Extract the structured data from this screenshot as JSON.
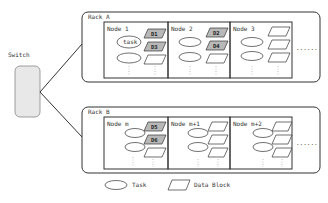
{
  "switch": {
    "label": "Switch"
  },
  "racks": [
    {
      "label": "Rack A",
      "nodes": [
        {
          "label": "Node 1",
          "task_label": "task",
          "blocks": [
            "D1",
            "D3",
            ""
          ]
        },
        {
          "label": "Node 2",
          "task_label": "",
          "blocks": [
            "D2",
            "D4",
            ""
          ]
        },
        {
          "label": "Node 3",
          "task_label": "",
          "blocks": [
            "",
            "",
            ""
          ]
        }
      ],
      "more": "......"
    },
    {
      "label": "Rack B",
      "nodes": [
        {
          "label": "Node m",
          "task_label": "",
          "blocks": [
            "D5",
            "D6",
            ""
          ]
        },
        {
          "label": "Node m+1",
          "task_label": "",
          "blocks": [
            "",
            "",
            ""
          ]
        },
        {
          "label": "Node m+2",
          "task_label": "",
          "blocks": [
            "",
            "",
            ""
          ]
        }
      ],
      "more": "......"
    }
  ],
  "legend": {
    "task": "Task",
    "data_block": "Data Block"
  },
  "colors": {
    "stroke": "#333333",
    "switch_fill": "#e8e8e8",
    "highlight_block": "#b8b8b8",
    "dots": "#999999"
  }
}
